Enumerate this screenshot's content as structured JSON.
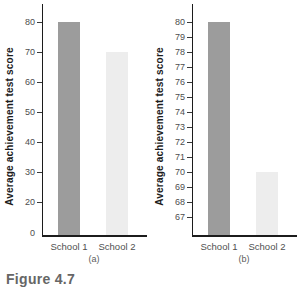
{
  "figure": {
    "caption": "Figure 4.7"
  },
  "chart_data": [
    {
      "type": "bar",
      "panel_label": "(a)",
      "title": "",
      "xlabel": "",
      "ylabel": "Average achievement test score",
      "categories": [
        "School 1",
        "School 2"
      ],
      "values": [
        80,
        70
      ],
      "bar_colors": [
        "#9c9c9c",
        "#ededed"
      ],
      "y_ticks": [
        80,
        70,
        60,
        50,
        40,
        30,
        20
      ],
      "origin_label": "0",
      "ylim": [
        0,
        85
      ],
      "grid": false,
      "legend": "none"
    },
    {
      "type": "bar",
      "panel_label": "(b)",
      "title": "",
      "xlabel": "",
      "ylabel": "Average achievement test score",
      "categories": [
        "School 1",
        "School 2"
      ],
      "values": [
        80,
        70
      ],
      "bar_colors": [
        "#9c9c9c",
        "#ededed"
      ],
      "y_ticks": [
        80,
        79,
        78,
        77,
        76,
        75,
        74,
        73,
        72,
        71,
        70,
        69,
        68,
        67
      ],
      "ylim": [
        66,
        81
      ],
      "grid": false,
      "legend": "none"
    }
  ],
  "colors": {
    "bar_dark": "#9c9c9c",
    "bar_light": "#ededed",
    "axis": "#1c1c1c",
    "tick_text": "#4d4d4d",
    "category_text": "#4f4f4f",
    "panel_label_text": "#5c5c5c",
    "title_text": "#1c1c1c",
    "caption_text": "#666666",
    "background": "#ffffff"
  }
}
